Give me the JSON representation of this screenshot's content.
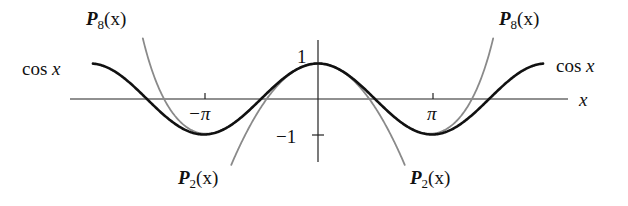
{
  "chart_data": {
    "type": "line",
    "title": "",
    "xlabel": "x",
    "ylabel": "",
    "xlim": [
      -6.9,
      6.9
    ],
    "ylim": [
      -1.8,
      1.7
    ],
    "grid": false,
    "legend": "inline labels",
    "x_ticks": [
      {
        "value": -3.14159,
        "label": "−π"
      },
      {
        "value": 3.14159,
        "label": "π"
      }
    ],
    "y_ticks": [
      {
        "value": 1,
        "label": "1"
      },
      {
        "value": -1,
        "label": "−1"
      }
    ],
    "series": [
      {
        "name": "cos x",
        "expr": "cos(x)",
        "domain": [
          -6.2,
          6.2
        ],
        "color": "#111111",
        "width": 2.6
      },
      {
        "name": "P2(x)",
        "expr": "1 - x^2/2",
        "domain": [
          -2.95,
          2.95
        ],
        "color": "#8a8a8a",
        "width": 1.8
      },
      {
        "name": "P8(x)",
        "expr": "1 - x^2/2 + x^4/24 - x^6/720 + x^8/40320",
        "domain": [
          -4.9,
          4.9
        ],
        "color": "#8a8a8a",
        "width": 1.8
      }
    ],
    "annotations": [
      {
        "text": "cos x",
        "position": "left end"
      },
      {
        "text": "cos x",
        "position": "right end"
      },
      {
        "text": "P8(x)",
        "position": "top-left"
      },
      {
        "text": "P8(x)",
        "position": "top-right"
      },
      {
        "text": "P2(x)",
        "position": "bottom-left"
      },
      {
        "text": "P2(x)",
        "position": "bottom-right"
      }
    ]
  },
  "labels": {
    "cos_left": "cos",
    "cos_right": "cos",
    "var_x": "x",
    "P": "P",
    "sub8": "8",
    "sub2": "2",
    "arg": "(x)",
    "tick_neg_pi": "−π",
    "tick_pi": "π",
    "tick_one": "1",
    "tick_neg_one": "−1",
    "axis_x": "x"
  }
}
